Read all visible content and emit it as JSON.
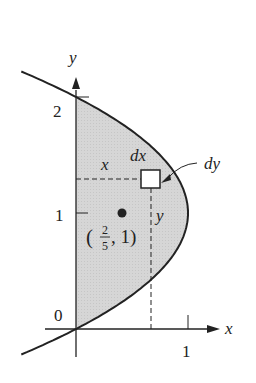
{
  "figure": {
    "colors": {
      "fill": "#d3d3d3",
      "curve": "#222222",
      "axis": "#222222",
      "background": "#ffffff"
    }
  },
  "axes": {
    "x_label": "x",
    "y_label": "y",
    "origin_label": "0",
    "x_ticks": [
      {
        "value": 1,
        "label": "1"
      }
    ],
    "y_ticks": [
      {
        "value": 1,
        "label": "1"
      },
      {
        "value": 2,
        "label": "2"
      }
    ]
  },
  "curve": {
    "equation": "x = 2y - y^2",
    "y_range": [
      -0.22,
      2.22
    ]
  },
  "centroid": {
    "label_open": "(",
    "num": "2",
    "den": "5",
    "label_rest": ", 1)",
    "x": 0.4,
    "y": 1
  },
  "element": {
    "dx_label": "dx",
    "dy_label": "dy",
    "x_label": "x",
    "y_label": "y",
    "center_x": 0.67,
    "center_y": 1.29
  }
}
